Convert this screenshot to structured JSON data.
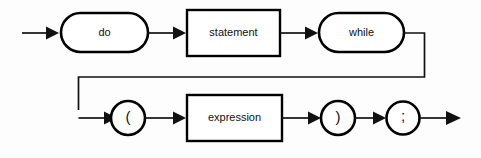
{
  "diagram": {
    "kind": "railroad-syntax-diagram",
    "background_color": "#fdfdfd",
    "line_color": "#111111",
    "shape_fill": "#ffffff",
    "nodes": [
      {
        "id": "do",
        "label": "do",
        "shape": "stadium",
        "role": "terminal"
      },
      {
        "id": "statement",
        "label": "statement",
        "shape": "rectangle",
        "role": "nonterminal"
      },
      {
        "id": "while",
        "label": "while",
        "shape": "stadium",
        "role": "terminal"
      },
      {
        "id": "lparen",
        "label": "(",
        "shape": "circle",
        "role": "terminal"
      },
      {
        "id": "expression",
        "label": "expression",
        "shape": "rectangle",
        "role": "nonterminal"
      },
      {
        "id": "rparen",
        "label": ")",
        "shape": "circle",
        "role": "terminal"
      },
      {
        "id": "semicolon",
        "label": ";",
        "shape": "circle",
        "role": "terminal"
      }
    ],
    "rows": [
      {
        "index": 1,
        "sequence": [
          "do",
          "statement",
          "while"
        ]
      },
      {
        "index": 2,
        "sequence": [
          "lparen",
          "expression",
          "rparen",
          "semicolon"
        ]
      }
    ],
    "icons": {
      "entry_arrow": "arrow-right-icon",
      "exit_arrow": "arrow-right-icon",
      "connector_arrow": "arrow-right-icon",
      "wrap_connector": "line-wrap-icon"
    }
  }
}
